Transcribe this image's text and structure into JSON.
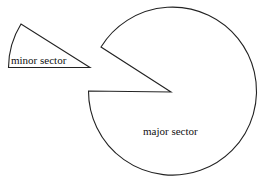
{
  "diagram": {
    "minor_sector": {
      "label": "minor sector",
      "vertex": [
        90,
        67
      ],
      "arc_start": [
        21,
        24
      ],
      "arc_end": [
        8,
        67
      ]
    },
    "major_sector": {
      "label": "major sector",
      "center": [
        171,
        92
      ],
      "radius": 84,
      "arc_start": [
        101,
        47
      ],
      "arc_end": [
        88,
        91
      ]
    },
    "colors": {
      "stroke": "#222222",
      "background": "#ffffff",
      "text": "#111111"
    }
  }
}
